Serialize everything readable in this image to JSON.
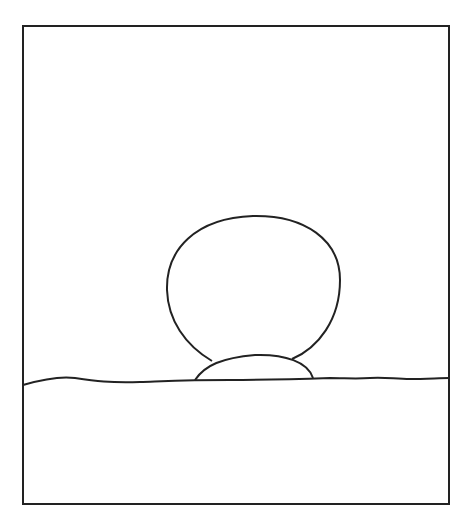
{
  "drawing": {
    "description": "Line drawing of a round shape resting on a small dome atop a wavy horizon line, inside a rectangular frame",
    "stroke_color": "#222222",
    "background_color": "#ffffff",
    "elements": [
      "frame",
      "horizon-line",
      "large-circle",
      "small-dome"
    ]
  }
}
